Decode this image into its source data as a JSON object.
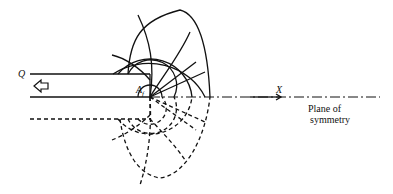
{
  "diagram": {
    "labels": {
      "q": "Q",
      "af_main": "A",
      "af_sub": "f",
      "x_axis": "X",
      "plane_line1": "Plane of",
      "plane_line2": "symmetry"
    },
    "colors": {
      "stroke": "#111111",
      "background": "#ffffff"
    }
  }
}
